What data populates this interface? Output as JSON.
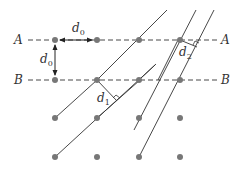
{
  "diagram": {
    "row_labels": {
      "A_left": "A",
      "A_right": "A",
      "B_left": "B",
      "B_right": "B"
    },
    "labels": {
      "d0_horizontal": "d",
      "d0_horizontal_sub": "0",
      "d0_vertical": "d",
      "d0_vertical_sub": "0",
      "d1": "d",
      "d1_sub": "1",
      "d2": "d",
      "d2_sub": "2"
    },
    "colors": {
      "dot": "#777777",
      "line": "#333333",
      "text": "#333333"
    },
    "lattice": {
      "columns_x": [
        55,
        97,
        139,
        180
      ],
      "rows_y": [
        40,
        80,
        118,
        157
      ]
    }
  }
}
